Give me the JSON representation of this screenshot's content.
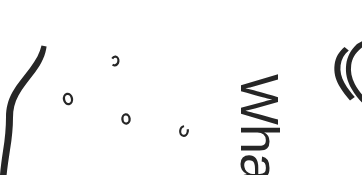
{
  "canvas": {
    "width": 362,
    "height": 175,
    "background_color": "#ffffff",
    "ink_color": "#262626"
  },
  "text": {
    "rotated_word": "Wha",
    "rotation_degrees": 90,
    "clipped": true,
    "color": "#262626"
  },
  "marks": {
    "left_stroke_label": "tapered-s-curve-stroke",
    "right_strokes_label": "nested-curved-strokes",
    "dots": [
      {
        "label": "small-o-mark-1",
        "x": 68,
        "y": 99,
        "rx": 4.0,
        "ry": 5.2,
        "rotate": -12
      },
      {
        "label": "small-o-mark-2",
        "x": 115,
        "y": 61,
        "rx": 3.4,
        "ry": 4.4,
        "rotate": 8
      },
      {
        "label": "small-o-mark-3",
        "x": 126,
        "y": 119,
        "rx": 3.6,
        "ry": 4.6,
        "rotate": -6
      },
      {
        "label": "small-o-mark-4",
        "x": 184,
        "y": 131,
        "rx": 3.8,
        "ry": 4.8,
        "rotate": 10
      }
    ]
  }
}
